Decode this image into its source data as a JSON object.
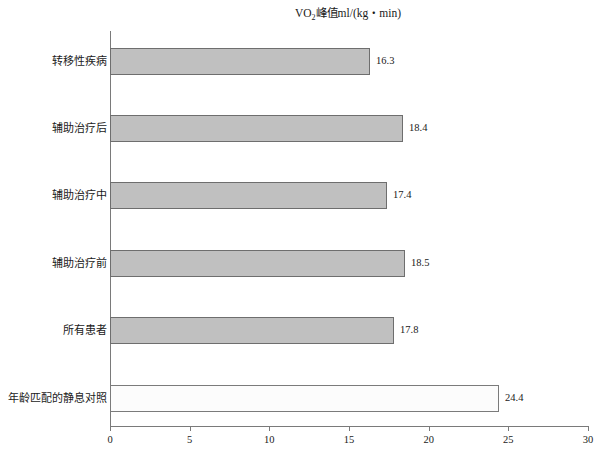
{
  "chart_data": {
    "type": "bar",
    "orientation": "horizontal",
    "title_main": "VO",
    "title_sub": "2",
    "title_rest": "峰值ml/(kg・min)",
    "xlabel": "",
    "ylabel": "",
    "xlim": [
      0,
      30
    ],
    "grid": false,
    "legend": null,
    "categories": [
      "转移性疾病",
      "辅助治疗后",
      "辅助治疗中",
      "辅助治疗前",
      "所有患者",
      "年龄匹配的静息对照"
    ],
    "values": [
      16.3,
      18.4,
      17.4,
      18.5,
      17.8,
      24.4
    ],
    "value_labels": [
      "16.3",
      "18.4",
      "17.4",
      "18.5",
      "17.8",
      "24.4"
    ],
    "xticks": [
      0,
      5,
      10,
      15,
      20,
      25,
      30
    ],
    "xtick_labels": [
      "0",
      "5",
      "10",
      "15",
      "20",
      "25",
      "30"
    ],
    "bar_styles": [
      "filled",
      "filled",
      "filled",
      "filled",
      "filled",
      "hollow"
    ],
    "colors": {
      "bar_fill": "#c0c0c0",
      "bar_fill_hollow": "#fcfcfc",
      "bar_border": "#6e6e6e",
      "axis": "#7a7a7a",
      "text": "#1a1a1a",
      "background": "#ffffff"
    }
  }
}
